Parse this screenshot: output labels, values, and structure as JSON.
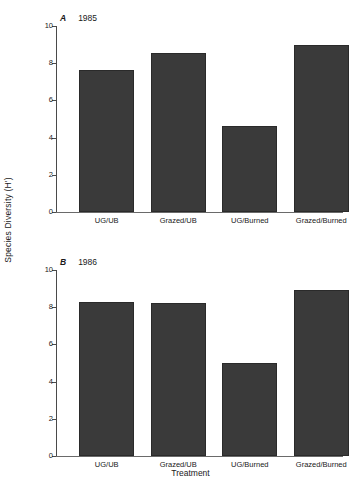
{
  "chart_data": [
    {
      "type": "bar",
      "panel": "A",
      "panel_letter": "A",
      "panel_year": "1985",
      "title": "A 1985",
      "categories": [
        "UG/UB",
        "Grazed/UB",
        "UG/Burned",
        "Grazed/Burned"
      ],
      "values": [
        7.65,
        8.55,
        4.6,
        9.0
      ],
      "xlabel": "",
      "ylabel": "Species Diversity (H')",
      "ylim": [
        0,
        10
      ],
      "yticks": [
        0,
        2,
        4,
        6,
        8,
        10
      ],
      "ytick_labels": [
        "0",
        "2",
        "4",
        "6",
        "8",
        "10"
      ],
      "grid": false,
      "legend": false,
      "bar_color": "#3a3a3a"
    },
    {
      "type": "bar",
      "panel": "B",
      "panel_letter": "B",
      "panel_year": "1986",
      "title": "B 1986",
      "categories": [
        "UG/UB",
        "Grazed/UB",
        "UG/Burned",
        "Grazed/Burned"
      ],
      "values": [
        8.3,
        8.25,
        5.0,
        8.9
      ],
      "xlabel": "Treatment",
      "ylabel": "Species Diversity (H')",
      "ylim": [
        0,
        10
      ],
      "yticks": [
        0,
        2,
        4,
        6,
        8,
        10
      ],
      "ytick_labels": [
        "0",
        "2",
        "4",
        "6",
        "8",
        "10"
      ],
      "grid": false,
      "legend": false,
      "bar_color": "#3a3a3a"
    }
  ],
  "axes": {
    "y_title": "Species Diversity (H')",
    "x_title": "Treatment"
  },
  "colors": {
    "bar": "#3a3a3a",
    "bar_edge": "#2a2a2a",
    "axis": "#4a4a4a",
    "text": "#1a1a1a",
    "background": "#ffffff"
  }
}
